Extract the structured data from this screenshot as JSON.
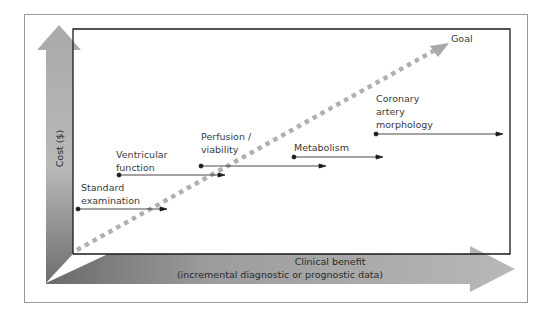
{
  "diagram": {
    "y_axis_label": "Cost ($)",
    "x_axis_label_line1": "Clinical benefit",
    "x_axis_label_line2": "(incremental diagnostic or prognostic data)",
    "goal_label": "Goal",
    "items": [
      {
        "label": "Standard\nexamination",
        "dot_x": 78,
        "y": 209,
        "end_x": 167
      },
      {
        "label": "Ventricular\nfunction",
        "dot_x": 119,
        "y": 175,
        "end_x": 225
      },
      {
        "label": "Perfusion /\nviability",
        "dot_x": 201,
        "y": 166,
        "end_x": 326
      },
      {
        "label": "Metabolism",
        "dot_x": 294,
        "y": 157,
        "end_x": 383
      },
      {
        "label": "Coronary\nartery\nmorphology",
        "dot_x": 376,
        "y": 134,
        "end_x": 503
      }
    ],
    "colors": {
      "arrow_gray": "#a8a8a8",
      "dotted_line": "#b0b0b0",
      "frame": "#1a1a1a",
      "outer_frame": "#9a9a9a",
      "text": "#3a3a3a"
    }
  }
}
